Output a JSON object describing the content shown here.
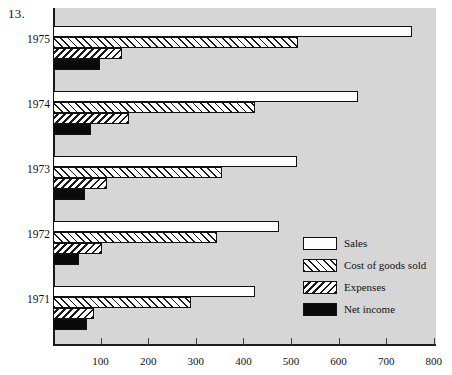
{
  "figure": {
    "number": "13."
  },
  "chart_data": {
    "type": "bar",
    "orientation": "horizontal",
    "title": "",
    "subtitle": "",
    "xlabel": "",
    "ylabel": "",
    "xlim": [
      0,
      800
    ],
    "ylim": null,
    "grid": false,
    "legend_position": "inside-right",
    "axis_ticks": [
      0,
      100,
      200,
      300,
      400,
      500,
      600,
      700,
      800
    ],
    "axis_tick_labels": [
      "",
      "100",
      "200",
      "300",
      "400",
      "500",
      "600",
      "700",
      "800"
    ],
    "categories": [
      "1975",
      "1974",
      "1973",
      "1972",
      "1971"
    ],
    "series": [
      {
        "name": "Sales",
        "pattern": "solid-white",
        "values": [
          755,
          640,
          513,
          475,
          425
        ]
      },
      {
        "name": "Cost of goods sold",
        "pattern": "hatch-forward",
        "values": [
          515,
          425,
          355,
          345,
          289
        ]
      },
      {
        "name": "Expenses",
        "pattern": "hatch-backward",
        "values": [
          145,
          160,
          113,
          103,
          86
        ]
      },
      {
        "name": "Net income",
        "pattern": "solid-black",
        "values": [
          99,
          79,
          67,
          54,
          71
        ]
      }
    ]
  },
  "legend": {
    "items": [
      {
        "label": "Sales",
        "swatch": "sales-swatch"
      },
      {
        "label": "Cost of goods sold",
        "swatch": "cogs-swatch"
      },
      {
        "label": "Expenses",
        "swatch": "expenses-swatch"
      },
      {
        "label": "Net income",
        "swatch": "net-income-swatch"
      }
    ]
  },
  "colors": {
    "plot_background": "#d6d6d6",
    "page_background": "#ffffff",
    "ink": "#111111",
    "bar_fill_light": "#ffffff",
    "bar_fill_dark": "#0a0a0a"
  }
}
